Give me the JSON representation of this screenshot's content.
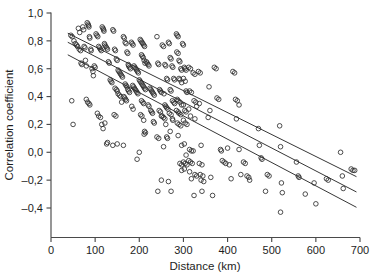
{
  "figure": {
    "background_color": "#ffffff",
    "marker_color": "#2e2e2e",
    "line_color": "#2b2b2b",
    "axis_color": "#4a4a4a"
  },
  "chart_data": {
    "type": "scatter",
    "title": "",
    "xlabel": "Distance (km)",
    "ylabel": "Correlation coefficient",
    "xlim": [
      0,
      700
    ],
    "ylim": [
      -0.45,
      1.0
    ],
    "grid": false,
    "legend": "none",
    "xticks": [
      0,
      100,
      200,
      300,
      400,
      500,
      600,
      700
    ],
    "xticklabels": [
      "0",
      "100",
      "200",
      "300",
      "400",
      "500",
      "600",
      "700"
    ],
    "yticks": [
      1.0,
      0.8,
      0.6,
      0.4,
      0.2,
      0.0,
      -0.2,
      -0.4
    ],
    "yticklabels": [
      "1,0",
      "0,8",
      "0,6",
      "0,4",
      "0,2",
      "0,0",
      "–0,2",
      "–0,4"
    ],
    "marker": "open-circle",
    "marker_size": 4.6,
    "n_points": 251,
    "points": [
      [
        45,
        0.84
      ],
      [
        48,
        0.83
      ],
      [
        52,
        0.8
      ],
      [
        47,
        0.37
      ],
      [
        50,
        0.2
      ],
      [
        55,
        0.78
      ],
      [
        58,
        0.77
      ],
      [
        60,
        0.76
      ],
      [
        62,
        0.89
      ],
      [
        65,
        0.86
      ],
      [
        64,
        0.74
      ],
      [
        67,
        0.73
      ],
      [
        68,
        0.64
      ],
      [
        70,
        0.63
      ],
      [
        72,
        0.9
      ],
      [
        74,
        0.88
      ],
      [
        75,
        0.76
      ],
      [
        77,
        0.75
      ],
      [
        78,
        0.66
      ],
      [
        80,
        0.62
      ],
      [
        82,
        0.93
      ],
      [
        84,
        0.92
      ],
      [
        85,
        0.91
      ],
      [
        86,
        0.9
      ],
      [
        87,
        0.83
      ],
      [
        88,
        0.82
      ],
      [
        90,
        0.74
      ],
      [
        91,
        0.73
      ],
      [
        93,
        0.6
      ],
      [
        95,
        0.58
      ],
      [
        96,
        0.55
      ],
      [
        80,
        0.38
      ],
      [
        83,
        0.36
      ],
      [
        86,
        0.35
      ],
      [
        88,
        0.34
      ],
      [
        98,
        0.62
      ],
      [
        100,
        0.61
      ],
      [
        102,
        0.85
      ],
      [
        104,
        0.84
      ],
      [
        106,
        0.83
      ],
      [
        108,
        0.76
      ],
      [
        110,
        0.75
      ],
      [
        112,
        0.74
      ],
      [
        114,
        0.73
      ],
      [
        116,
        0.9
      ],
      [
        118,
        0.89
      ],
      [
        119,
        0.88
      ],
      [
        120,
        0.87
      ],
      [
        121,
        0.78
      ],
      [
        122,
        0.77
      ],
      [
        124,
        0.76
      ],
      [
        126,
        0.75
      ],
      [
        128,
        0.74
      ],
      [
        130,
        0.65
      ],
      [
        132,
        0.64
      ],
      [
        134,
        0.52
      ],
      [
        136,
        0.51
      ],
      [
        138,
        0.5
      ],
      [
        105,
        0.28
      ],
      [
        108,
        0.26
      ],
      [
        112,
        0.25
      ],
      [
        115,
        0.2
      ],
      [
        118,
        0.17
      ],
      [
        122,
        0.21
      ],
      [
        126,
        0.06
      ],
      [
        128,
        0.07
      ],
      [
        140,
        0.88
      ],
      [
        142,
        0.87
      ],
      [
        144,
        0.74
      ],
      [
        146,
        0.73
      ],
      [
        148,
        0.67
      ],
      [
        150,
        0.66
      ],
      [
        152,
        0.59
      ],
      [
        154,
        0.58
      ],
      [
        156,
        0.57
      ],
      [
        158,
        0.56
      ],
      [
        160,
        0.55
      ],
      [
        162,
        0.54
      ],
      [
        145,
        0.46
      ],
      [
        148,
        0.45
      ],
      [
        150,
        0.44
      ],
      [
        152,
        0.42
      ],
      [
        155,
        0.41
      ],
      [
        158,
        0.4
      ],
      [
        160,
        0.36
      ],
      [
        143,
        0.27
      ],
      [
        147,
        0.26
      ],
      [
        140,
        0.05
      ],
      [
        150,
        0.06
      ],
      [
        164,
        0.83
      ],
      [
        166,
        0.82
      ],
      [
        168,
        0.79
      ],
      [
        170,
        0.78
      ],
      [
        172,
        0.72
      ],
      [
        174,
        0.71
      ],
      [
        175,
        0.63
      ],
      [
        176,
        0.62
      ],
      [
        178,
        0.61
      ],
      [
        180,
        0.6
      ],
      [
        168,
        0.49
      ],
      [
        170,
        0.48
      ],
      [
        172,
        0.47
      ],
      [
        174,
        0.45
      ],
      [
        176,
        0.44
      ],
      [
        178,
        0.43
      ],
      [
        165,
        0.4
      ],
      [
        167,
        0.39
      ],
      [
        169,
        0.38
      ],
      [
        171,
        0.37
      ],
      [
        164,
        0.05
      ],
      [
        182,
        0.79
      ],
      [
        184,
        0.78
      ],
      [
        186,
        0.77
      ],
      [
        188,
        0.62
      ],
      [
        190,
        0.61
      ],
      [
        192,
        0.6
      ],
      [
        194,
        0.59
      ],
      [
        196,
        0.58
      ],
      [
        198,
        0.57
      ],
      [
        185,
        0.48
      ],
      [
        187,
        0.47
      ],
      [
        189,
        0.46
      ],
      [
        191,
        0.45
      ],
      [
        193,
        0.44
      ],
      [
        195,
        0.43
      ],
      [
        197,
        0.42
      ],
      [
        183,
        0.33
      ],
      [
        186,
        0.31
      ],
      [
        195,
        -0.05
      ],
      [
        200,
        0.0
      ],
      [
        202,
        0.81
      ],
      [
        204,
        0.8
      ],
      [
        206,
        0.79
      ],
      [
        208,
        0.78
      ],
      [
        210,
        0.77
      ],
      [
        212,
        0.76
      ],
      [
        205,
        0.7
      ],
      [
        207,
        0.69
      ],
      [
        209,
        0.68
      ],
      [
        211,
        0.66
      ],
      [
        213,
        0.64
      ],
      [
        200,
        0.52
      ],
      [
        202,
        0.51
      ],
      [
        204,
        0.5
      ],
      [
        206,
        0.49
      ],
      [
        208,
        0.48
      ],
      [
        210,
        0.47
      ],
      [
        212,
        0.46
      ],
      [
        214,
        0.45
      ],
      [
        205,
        0.37
      ],
      [
        208,
        0.36
      ],
      [
        210,
        0.35
      ],
      [
        203,
        0.27
      ],
      [
        206,
        0.26
      ],
      [
        210,
        0.23
      ],
      [
        212,
        0.15
      ],
      [
        214,
        0.14
      ],
      [
        211,
        0.13
      ],
      [
        216,
        0.65
      ],
      [
        218,
        0.64
      ],
      [
        220,
        0.63
      ],
      [
        222,
        0.62
      ],
      [
        224,
        0.46
      ],
      [
        226,
        0.45
      ],
      [
        228,
        0.44
      ],
      [
        230,
        0.43
      ],
      [
        232,
        0.42
      ],
      [
        234,
        0.41
      ],
      [
        220,
        0.34
      ],
      [
        222,
        0.33
      ],
      [
        226,
        0.3
      ],
      [
        228,
        0.29
      ],
      [
        230,
        0.28
      ],
      [
        232,
        0.22
      ],
      [
        234,
        0.21
      ],
      [
        240,
        0.83
      ],
      [
        242,
        0.64
      ],
      [
        244,
        0.63
      ],
      [
        246,
        0.45
      ],
      [
        248,
        0.44
      ],
      [
        250,
        0.43
      ],
      [
        245,
        0.3
      ],
      [
        248,
        0.29
      ],
      [
        250,
        0.26
      ],
      [
        240,
        0.11
      ],
      [
        244,
        0.1
      ],
      [
        242,
        -0.28
      ],
      [
        252,
        0.77
      ],
      [
        255,
        0.76
      ],
      [
        258,
        0.63
      ],
      [
        260,
        0.62
      ],
      [
        262,
        0.53
      ],
      [
        264,
        0.52
      ],
      [
        256,
        0.42
      ],
      [
        258,
        0.34
      ],
      [
        260,
        0.33
      ],
      [
        262,
        0.32
      ],
      [
        265,
        0.31
      ],
      [
        252,
        0.26
      ],
      [
        255,
        0.25
      ],
      [
        258,
        0.24
      ],
      [
        260,
        0.2
      ],
      [
        262,
        0.11
      ],
      [
        264,
        0.1
      ],
      [
        255,
        0.04
      ],
      [
        250,
        -0.2
      ],
      [
        266,
        0.79
      ],
      [
        268,
        0.78
      ],
      [
        270,
        0.68
      ],
      [
        272,
        0.67
      ],
      [
        274,
        0.62
      ],
      [
        276,
        0.61
      ],
      [
        278,
        0.53
      ],
      [
        280,
        0.52
      ],
      [
        270,
        0.45
      ],
      [
        272,
        0.44
      ],
      [
        275,
        0.37
      ],
      [
        278,
        0.36
      ],
      [
        280,
        0.35
      ],
      [
        268,
        0.28
      ],
      [
        272,
        0.27
      ],
      [
        275,
        0.24
      ],
      [
        276,
        0.23
      ],
      [
        270,
        0.15
      ],
      [
        266,
        -0.21
      ],
      [
        272,
        -0.28
      ],
      [
        284,
        0.85
      ],
      [
        286,
        0.84
      ],
      [
        288,
        0.83
      ],
      [
        285,
        0.72
      ],
      [
        288,
        0.71
      ],
      [
        290,
        0.66
      ],
      [
        292,
        0.65
      ],
      [
        294,
        0.6
      ],
      [
        296,
        0.59
      ],
      [
        290,
        0.53
      ],
      [
        292,
        0.52
      ],
      [
        296,
        0.5
      ],
      [
        286,
        0.38
      ],
      [
        288,
        0.37
      ],
      [
        292,
        0.36
      ],
      [
        296,
        0.34
      ],
      [
        284,
        0.3
      ],
      [
        288,
        0.29
      ],
      [
        290,
        0.28
      ],
      [
        294,
        0.27
      ],
      [
        286,
        0.21
      ],
      [
        290,
        0.2
      ],
      [
        294,
        0.19
      ],
      [
        288,
        0.12
      ],
      [
        296,
        0.05
      ],
      [
        292,
        -0.08
      ],
      [
        296,
        -0.09
      ],
      [
        298,
        0.78
      ],
      [
        300,
        0.77
      ],
      [
        302,
        0.61
      ],
      [
        304,
        0.6
      ],
      [
        306,
        0.59
      ],
      [
        300,
        0.53
      ],
      [
        304,
        0.51
      ],
      [
        306,
        0.44
      ],
      [
        308,
        0.43
      ],
      [
        300,
        0.34
      ],
      [
        303,
        0.3
      ],
      [
        306,
        0.29
      ],
      [
        300,
        0.23
      ],
      [
        304,
        0.21
      ],
      [
        308,
        0.2
      ],
      [
        302,
        0.06
      ],
      [
        306,
        -0.02
      ],
      [
        300,
        -0.07
      ],
      [
        304,
        -0.08
      ],
      [
        308,
        -0.09
      ],
      [
        296,
        -0.13
      ],
      [
        302,
        -0.12
      ],
      [
        312,
        0.61
      ],
      [
        316,
        0.6
      ],
      [
        314,
        0.44
      ],
      [
        318,
        0.43
      ],
      [
        312,
        0.31
      ],
      [
        316,
        0.26
      ],
      [
        314,
        0.02
      ],
      [
        318,
        0.01
      ],
      [
        312,
        -0.06
      ],
      [
        316,
        -0.07
      ],
      [
        320,
        -0.08
      ],
      [
        314,
        -0.14
      ],
      [
        318,
        -0.19
      ],
      [
        322,
        0.57
      ],
      [
        326,
        0.56
      ],
      [
        324,
        0.37
      ],
      [
        328,
        0.36
      ],
      [
        330,
        0.33
      ],
      [
        326,
        0.24
      ],
      [
        322,
        0.01
      ],
      [
        326,
        -0.16
      ],
      [
        330,
        -0.17
      ],
      [
        324,
        -0.31
      ],
      [
        334,
        0.58
      ],
      [
        338,
        0.57
      ],
      [
        336,
        0.35
      ],
      [
        340,
        0.05
      ],
      [
        336,
        -0.08
      ],
      [
        342,
        -0.09
      ],
      [
        338,
        -0.16
      ],
      [
        344,
        -0.17
      ],
      [
        340,
        -0.2
      ],
      [
        346,
        -0.21
      ],
      [
        342,
        -0.28
      ],
      [
        470,
        0.17
      ],
      [
        472,
        0.05
      ],
      [
        476,
        -0.04
      ],
      [
        478,
        -0.05
      ],
      [
        486,
        -0.28
      ],
      [
        490,
        -0.16
      ],
      [
        494,
        -0.17
      ],
      [
        518,
        0.19
      ],
      [
        520,
        0.04
      ],
      [
        522,
        -0.22
      ],
      [
        524,
        -0.29
      ],
      [
        520,
        -0.43
      ],
      [
        556,
        -0.07
      ],
      [
        560,
        -0.17
      ],
      [
        562,
        -0.18
      ],
      [
        576,
        -0.3
      ],
      [
        596,
        -0.22
      ],
      [
        600,
        -0.37
      ],
      [
        624,
        -0.19
      ],
      [
        628,
        -0.2
      ],
      [
        656,
        0.0
      ],
      [
        660,
        -0.17
      ],
      [
        662,
        -0.26
      ],
      [
        680,
        -0.12
      ],
      [
        684,
        -0.13
      ],
      [
        688,
        -0.13
      ],
      [
        358,
        0.47
      ],
      [
        360,
        0.3
      ],
      [
        356,
        0.25
      ],
      [
        362,
        -0.18
      ],
      [
        366,
        -0.31
      ],
      [
        370,
        0.61
      ],
      [
        374,
        0.6
      ],
      [
        376,
        0.39
      ],
      [
        380,
        0.38
      ],
      [
        384,
        0.02
      ],
      [
        386,
        0.01
      ],
      [
        388,
        -0.06
      ],
      [
        392,
        -0.07
      ],
      [
        396,
        -0.08
      ],
      [
        400,
        0.03
      ],
      [
        404,
        -0.09
      ],
      [
        408,
        -0.19
      ],
      [
        412,
        0.58
      ],
      [
        416,
        0.57
      ],
      [
        420,
        0.24
      ],
      [
        426,
        0.02
      ],
      [
        430,
        -0.16
      ],
      [
        436,
        -0.07
      ],
      [
        440,
        -0.08
      ],
      [
        444,
        -0.17
      ],
      [
        448,
        -0.18
      ],
      [
        450,
        -0.2
      ],
      [
        418,
        0.38
      ],
      [
        422,
        0.37
      ],
      [
        426,
        0.34
      ]
    ],
    "fit_lines": [
      {
        "name": "upper-fit",
        "x_start": 38,
        "y_start": 0.855,
        "x_end": 692,
        "y_end": -0.175
      },
      {
        "name": "middle-fit",
        "x_start": 38,
        "y_start": 0.79,
        "x_end": 692,
        "y_end": -0.285
      },
      {
        "name": "lower-fit",
        "x_start": 38,
        "y_start": 0.7,
        "x_end": 692,
        "y_end": -0.395
      }
    ]
  }
}
